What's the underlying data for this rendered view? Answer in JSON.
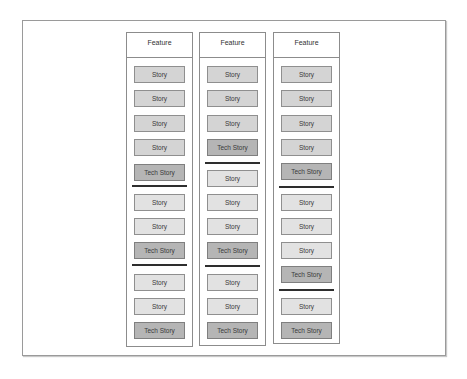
{
  "diagram": {
    "columns": [
      {
        "header": "Feature",
        "left": 126,
        "height": 313,
        "items": [
          {
            "type": "story",
            "label": "Story",
            "top": 33,
            "shade": "normal"
          },
          {
            "type": "story",
            "label": "Story",
            "top": 57,
            "shade": "normal"
          },
          {
            "type": "story",
            "label": "Story",
            "top": 82,
            "shade": "normal"
          },
          {
            "type": "story",
            "label": "Story",
            "top": 106,
            "shade": "normal"
          },
          {
            "type": "tech",
            "label": "Tech Story",
            "top": 131
          },
          {
            "type": "separator",
            "top": 152
          },
          {
            "type": "story",
            "label": "Story",
            "top": 161,
            "shade": "light"
          },
          {
            "type": "story",
            "label": "Story",
            "top": 185,
            "shade": "light"
          },
          {
            "type": "tech",
            "label": "Tech Story",
            "top": 209
          },
          {
            "type": "separator",
            "top": 231
          },
          {
            "type": "story",
            "label": "Story",
            "top": 241,
            "shade": "light"
          },
          {
            "type": "story",
            "label": "Story",
            "top": 265,
            "shade": "light"
          },
          {
            "type": "tech",
            "label": "Tech Story",
            "top": 289
          }
        ]
      },
      {
        "header": "Feature",
        "left": 199,
        "height": 312,
        "items": [
          {
            "type": "story",
            "label": "Story",
            "top": 33,
            "shade": "normal"
          },
          {
            "type": "story",
            "label": "Story",
            "top": 57,
            "shade": "normal"
          },
          {
            "type": "story",
            "label": "Story",
            "top": 82,
            "shade": "normal"
          },
          {
            "type": "tech",
            "label": "Tech Story",
            "top": 106
          },
          {
            "type": "separator",
            "top": 129
          },
          {
            "type": "story",
            "label": "Story",
            "top": 137,
            "shade": "light"
          },
          {
            "type": "story",
            "label": "Story",
            "top": 161,
            "shade": "light"
          },
          {
            "type": "story",
            "label": "Story",
            "top": 185,
            "shade": "light"
          },
          {
            "type": "tech",
            "label": "Tech Story",
            "top": 209
          },
          {
            "type": "separator",
            "top": 232
          },
          {
            "type": "story",
            "label": "Story",
            "top": 241,
            "shade": "light"
          },
          {
            "type": "story",
            "label": "Story",
            "top": 265,
            "shade": "light"
          },
          {
            "type": "tech",
            "label": "Tech Story",
            "top": 289
          }
        ]
      },
      {
        "header": "Feature",
        "left": 273,
        "height": 310,
        "items": [
          {
            "type": "story",
            "label": "Story",
            "top": 33,
            "shade": "normal"
          },
          {
            "type": "story",
            "label": "Story",
            "top": 57,
            "shade": "normal"
          },
          {
            "type": "story",
            "label": "Story",
            "top": 82,
            "shade": "normal"
          },
          {
            "type": "story",
            "label": "Story",
            "top": 106,
            "shade": "normal"
          },
          {
            "type": "tech",
            "label": "Tech Story",
            "top": 130
          },
          {
            "type": "separator",
            "top": 153
          },
          {
            "type": "story",
            "label": "Story",
            "top": 161,
            "shade": "light"
          },
          {
            "type": "story",
            "label": "Story",
            "top": 185,
            "shade": "light"
          },
          {
            "type": "story",
            "label": "Story",
            "top": 209,
            "shade": "light"
          },
          {
            "type": "tech",
            "label": "Tech Story",
            "top": 233
          },
          {
            "type": "separator",
            "top": 256
          },
          {
            "type": "story",
            "label": "Story",
            "top": 265,
            "shade": "light"
          },
          {
            "type": "tech",
            "label": "Tech Story",
            "top": 289
          }
        ]
      }
    ]
  }
}
